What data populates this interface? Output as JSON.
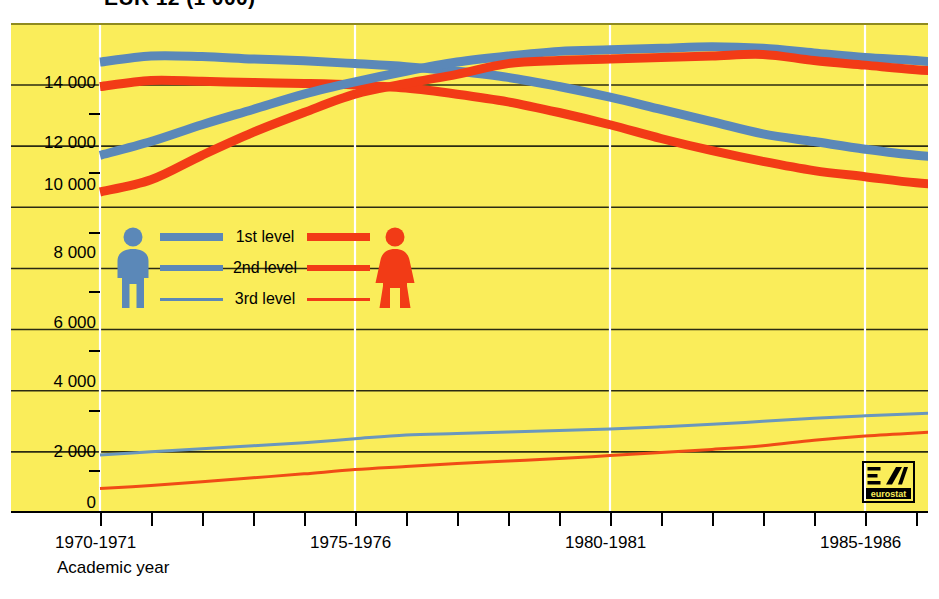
{
  "title": "EUR 12 (1 000)",
  "axis": {
    "x_caption": "Academic year",
    "x_labels": [
      "1970-1971",
      "1975-1976",
      "1980-1981",
      "1985-1986"
    ],
    "y_labels": [
      "14 000",
      "12 000",
      "10 000",
      "8 000",
      "6 000",
      "4 000",
      "2 000",
      "0"
    ]
  },
  "legend": {
    "items": [
      {
        "label": "1st level"
      },
      {
        "label": "2nd level"
      },
      {
        "label": "3rd level"
      }
    ],
    "male_icon": "male-pictogram",
    "female_icon": "female-pictogram"
  },
  "logo": {
    "text": "eurostat",
    "mark": "eurostat-mark"
  },
  "colors": {
    "background": "#faed5a",
    "male": "#5b88b8",
    "female": "#f23b16",
    "grid": "#2b2b12",
    "vertical_grid": "#ffffff",
    "axis": "#000000"
  },
  "chart_data": {
    "type": "line",
    "title": "EUR 12 (1 000)",
    "xlabel": "Academic year",
    "ylabel": "",
    "ylim": [
      0,
      15500
    ],
    "xlim": [
      1970,
      1987
    ],
    "grid": true,
    "legend_position": "center-left",
    "x": [
      1970,
      1971,
      1972,
      1973,
      1974,
      1975,
      1976,
      1977,
      1978,
      1979,
      1980,
      1981,
      1982,
      1983,
      1984,
      1985,
      1986,
      1987
    ],
    "x_tick_labels": [
      "1970-1971",
      "1975-1976",
      "1980-1981",
      "1985-1986"
    ],
    "x_tick_values": [
      1970,
      1975,
      1980,
      1985
    ],
    "y_tick_values": [
      0,
      2000,
      4000,
      6000,
      8000,
      10000,
      12000,
      14000
    ],
    "series": [
      {
        "name": "1st level - male",
        "sex": "male",
        "level": "1st level",
        "color": "#5b88b8",
        "width": 9,
        "values": [
          14750,
          14950,
          14930,
          14850,
          14790,
          14700,
          14600,
          14450,
          14250,
          13950,
          13600,
          13200,
          12800,
          12400,
          12150,
          11900,
          11700,
          11600
        ]
      },
      {
        "name": "1st level - female",
        "sex": "female",
        "level": "1st level",
        "color": "#f23b16",
        "width": 9,
        "values": [
          13950,
          14150,
          14120,
          14080,
          14050,
          14000,
          13900,
          13700,
          13450,
          13100,
          12700,
          12250,
          11850,
          11500,
          11200,
          11000,
          10800,
          10700
        ]
      },
      {
        "name": "2nd level - male",
        "sex": "male",
        "level": "2nd level",
        "color": "#5b88b8",
        "width": 9,
        "values": [
          11700,
          12150,
          12700,
          13200,
          13700,
          14100,
          14450,
          14750,
          14950,
          15100,
          15150,
          15200,
          15250,
          15200,
          15050,
          14900,
          14800,
          14650
        ]
      },
      {
        "name": "2nd level - female",
        "sex": "female",
        "level": "2nd level",
        "color": "#f23b16",
        "width": 9,
        "values": [
          10500,
          10900,
          11700,
          12450,
          13100,
          13700,
          14050,
          14350,
          14700,
          14800,
          14850,
          14900,
          14950,
          15000,
          14800,
          14650,
          14500,
          14400
        ]
      },
      {
        "name": "3rd level - male",
        "sex": "male",
        "level": "3rd level",
        "color": "#6a97bd",
        "width": 3,
        "values": [
          1900,
          2000,
          2100,
          2200,
          2300,
          2430,
          2550,
          2600,
          2650,
          2700,
          2750,
          2820,
          2900,
          3000,
          3100,
          3180,
          3250,
          3320
        ]
      },
      {
        "name": "3rd level - female",
        "sex": "female",
        "level": "3rd level",
        "color": "#f04b16",
        "width": 3,
        "values": [
          800,
          900,
          1020,
          1150,
          1280,
          1420,
          1520,
          1620,
          1700,
          1780,
          1880,
          1980,
          2080,
          2200,
          2380,
          2520,
          2620,
          2700
        ]
      }
    ]
  }
}
